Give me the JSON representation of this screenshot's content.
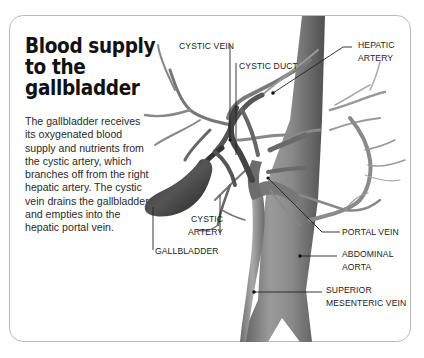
{
  "title": "Blood supply to the gallbladder",
  "title_lines": [
    "Blood supply",
    "to the",
    "gallbladder"
  ],
  "description": "The gallbladder receives its oxygenated blood supply and nutrients from the cystic artery, which branches off from the right hepatic artery. The cystic vein drains the gallbladder and empties into the hepatic portal vein.",
  "labels": {
    "cystic_vein": "CYSTIC VEIN",
    "cystic_duct": "CYSTIC DUCT",
    "hepatic_artery_1": "HEPATIC",
    "hepatic_artery_2": "ARTERY",
    "cystic_artery_1": "CYSTIC",
    "cystic_artery_2": "ARTERY",
    "gallbladder": "GALLBLADDER",
    "portal_vein": "PORTAL VEIN",
    "abdominal_aorta_1": "ABDOMINAL",
    "abdominal_aorta_2": "AORTA",
    "sup_mesenteric_vein_1": "SUPERIOR",
    "sup_mesenteric_vein_2": "MESENTERIC VEIN"
  },
  "colors": {
    "vessel_dark": "#4a4a4a",
    "vessel_mid": "#8a8a8a",
    "vessel_light": "#bdbdbd",
    "frame": "#b8b8b8"
  }
}
